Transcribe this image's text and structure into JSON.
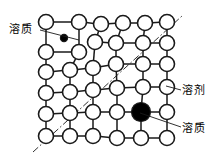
{
  "figure": {
    "background_color": "#ffffff",
    "stroke_color": "#1a1a1a",
    "node_fill": "#ffffff",
    "solute_fill": "#000000"
  },
  "labels": {
    "solute_top": {
      "text": "溶质",
      "meaning": "solute",
      "leader_from": [
        40,
        30
      ],
      "leader_to": [
        79,
        40
      ]
    },
    "solvent_right": {
      "text": "溶剂",
      "meaning": "solvent",
      "leader_from": [
        181,
        90
      ],
      "leader_to": [
        166,
        86
      ]
    },
    "solute_right": {
      "text": "溶质",
      "meaning": "solute",
      "leader_from": [
        181,
        127
      ],
      "leader_to": [
        140,
        113
      ]
    }
  },
  "chart_data": {
    "type": "scatter",
    "xlabel": "",
    "ylabel": "",
    "grid": false,
    "legend_position": "outside",
    "radius_open": 7.5,
    "radius_small_solute": 3.6,
    "radius_large_solute": 9.5,
    "nodes": [
      {
        "id": "n00",
        "x": 46,
        "y": 22,
        "kind": "solvent"
      },
      {
        "id": "n01",
        "x": 79,
        "y": 22,
        "kind": "solvent"
      },
      {
        "id": "n02",
        "x": 101,
        "y": 24,
        "kind": "solvent"
      },
      {
        "id": "n03",
        "x": 123,
        "y": 23,
        "kind": "solvent"
      },
      {
        "id": "n04",
        "x": 145,
        "y": 23,
        "kind": "solvent"
      },
      {
        "id": "n05",
        "x": 167,
        "y": 22,
        "kind": "solvent"
      },
      {
        "id": "n10",
        "x": 46,
        "y": 52,
        "kind": "solvent"
      },
      {
        "id": "n11",
        "x": 79,
        "y": 52,
        "kind": "solvent"
      },
      {
        "id": "n12",
        "x": 95,
        "y": 42,
        "kind": "solvent"
      },
      {
        "id": "n13",
        "x": 116,
        "y": 43,
        "kind": "solvent"
      },
      {
        "id": "n14",
        "x": 143,
        "y": 43,
        "kind": "solvent"
      },
      {
        "id": "n15",
        "x": 167,
        "y": 43,
        "kind": "solvent"
      },
      {
        "id": "n20",
        "x": 46,
        "y": 72,
        "kind": "solvent"
      },
      {
        "id": "n21",
        "x": 70,
        "y": 70,
        "kind": "solvent"
      },
      {
        "id": "n22",
        "x": 93,
        "y": 68,
        "kind": "solvent"
      },
      {
        "id": "n23",
        "x": 116,
        "y": 64,
        "kind": "solvent"
      },
      {
        "id": "n24",
        "x": 143,
        "y": 64,
        "kind": "solvent"
      },
      {
        "id": "n25",
        "x": 167,
        "y": 64,
        "kind": "solvent"
      },
      {
        "id": "n30",
        "x": 46,
        "y": 93,
        "kind": "solvent"
      },
      {
        "id": "n31",
        "x": 70,
        "y": 92,
        "kind": "solvent"
      },
      {
        "id": "n32",
        "x": 93,
        "y": 90,
        "kind": "solvent"
      },
      {
        "id": "n33",
        "x": 117,
        "y": 88,
        "kind": "solvent"
      },
      {
        "id": "n34",
        "x": 143,
        "y": 87,
        "kind": "solvent"
      },
      {
        "id": "n35",
        "x": 167,
        "y": 87,
        "kind": "solvent"
      },
      {
        "id": "n40",
        "x": 46,
        "y": 114,
        "kind": "solvent"
      },
      {
        "id": "n41",
        "x": 70,
        "y": 113,
        "kind": "solvent"
      },
      {
        "id": "n42",
        "x": 93,
        "y": 112,
        "kind": "solvent"
      },
      {
        "id": "n43",
        "x": 117,
        "y": 112,
        "kind": "solvent"
      },
      {
        "id": "n44",
        "x": 141,
        "y": 112,
        "kind": "solute_substitutional"
      },
      {
        "id": "n45",
        "x": 167,
        "y": 112,
        "kind": "solvent"
      },
      {
        "id": "n50",
        "x": 46,
        "y": 136,
        "kind": "solvent"
      },
      {
        "id": "n51",
        "x": 70,
        "y": 136,
        "kind": "solvent"
      },
      {
        "id": "n52",
        "x": 93,
        "y": 136,
        "kind": "solvent"
      },
      {
        "id": "n53",
        "x": 117,
        "y": 138,
        "kind": "solvent"
      },
      {
        "id": "n54",
        "x": 141,
        "y": 138,
        "kind": "solvent"
      },
      {
        "id": "n55",
        "x": 167,
        "y": 138,
        "kind": "solvent"
      },
      {
        "id": "s1",
        "x": 64,
        "y": 38,
        "kind": "solute_interstitial"
      }
    ],
    "bonds": [
      [
        "n00",
        "n01"
      ],
      [
        "n01",
        "n02"
      ],
      [
        "n02",
        "n03"
      ],
      [
        "n03",
        "n04"
      ],
      [
        "n04",
        "n05"
      ],
      [
        "n12",
        "n13"
      ],
      [
        "n13",
        "n14"
      ],
      [
        "n14",
        "n15"
      ],
      [
        "n20",
        "n21"
      ],
      [
        "n21",
        "n22"
      ],
      [
        "n22",
        "n23"
      ],
      [
        "n23",
        "n24"
      ],
      [
        "n24",
        "n25"
      ],
      [
        "n30",
        "n31"
      ],
      [
        "n31",
        "n32"
      ],
      [
        "n32",
        "n33"
      ],
      [
        "n33",
        "n34"
      ],
      [
        "n34",
        "n35"
      ],
      [
        "n40",
        "n41"
      ],
      [
        "n41",
        "n42"
      ],
      [
        "n42",
        "n43"
      ],
      [
        "n43",
        "n44"
      ],
      [
        "n44",
        "n45"
      ],
      [
        "n50",
        "n51"
      ],
      [
        "n51",
        "n52"
      ],
      [
        "n52",
        "n53"
      ],
      [
        "n53",
        "n54"
      ],
      [
        "n54",
        "n55"
      ],
      [
        "n10",
        "n11"
      ],
      [
        "n00",
        "n10"
      ],
      [
        "n10",
        "n20"
      ],
      [
        "n20",
        "n30"
      ],
      [
        "n30",
        "n40"
      ],
      [
        "n40",
        "n50"
      ],
      [
        "n01",
        "n11"
      ],
      [
        "n11",
        "n21"
      ],
      [
        "n21",
        "n31"
      ],
      [
        "n31",
        "n41"
      ],
      [
        "n41",
        "n51"
      ],
      [
        "n02",
        "n12"
      ],
      [
        "n12",
        "n22"
      ],
      [
        "n22",
        "n32"
      ],
      [
        "n32",
        "n42"
      ],
      [
        "n42",
        "n52"
      ],
      [
        "n03",
        "n13"
      ],
      [
        "n13",
        "n23"
      ],
      [
        "n23",
        "n33"
      ],
      [
        "n33",
        "n43"
      ],
      [
        "n43",
        "n53"
      ],
      [
        "n04",
        "n14"
      ],
      [
        "n14",
        "n24"
      ],
      [
        "n24",
        "n34"
      ],
      [
        "n34",
        "n44"
      ],
      [
        "n44",
        "n54"
      ],
      [
        "n05",
        "n15"
      ],
      [
        "n15",
        "n25"
      ],
      [
        "n25",
        "n35"
      ],
      [
        "n35",
        "n45"
      ],
      [
        "n45",
        "n55"
      ]
    ],
    "annotations": [
      {
        "name": "slip-plane-line",
        "style": "dash-dot",
        "from": [
          33,
          152
        ],
        "to": [
          182,
          16
        ]
      }
    ]
  }
}
